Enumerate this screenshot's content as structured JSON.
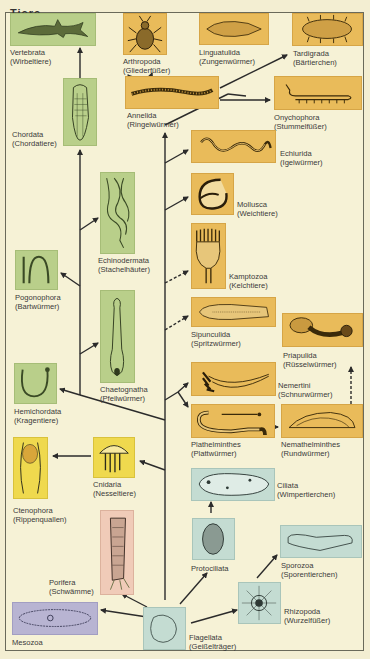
{
  "heading": "Tiere",
  "colors": {
    "background": "#f6f2d6",
    "protostomia_box": "#e9bb5a",
    "deuterostomia_box": "#b9cf8a",
    "cnidaria_box": "#efd94e",
    "protozoa_box": "#c4dcd2",
    "porifera_box": "#f0cbb8",
    "mesozoa_box": "#b8b4d2",
    "line": "#2b2b2b"
  },
  "taxa": {
    "vertebrata": {
      "name": "Vertebrata",
      "common": "(Wirbeltiere)"
    },
    "arthropoda": {
      "name": "Arthropoda",
      "common": "(Gliederfüßer)"
    },
    "linguatulida": {
      "name": "Linguatulida",
      "common": "(Zungenwürmer)"
    },
    "tardigrada": {
      "name": "Tardigrada",
      "common": "(Bärtierchen)"
    },
    "annelida": {
      "name": "Annelida",
      "common": "(Ringelwürmer)"
    },
    "onychophora": {
      "name": "Onychophora",
      "common": "(Stummelfüßer)"
    },
    "chordata": {
      "name": "Chordata",
      "common": "(Chordatiere)"
    },
    "echiurida": {
      "name": "Echiurida",
      "common": "(Igelwürmer)"
    },
    "mollusca": {
      "name": "Mollusca",
      "common": "(Weichtiere)"
    },
    "echinodermata": {
      "name": "Echinodermata",
      "common": "(Stachelhäuter)"
    },
    "kamptozoa": {
      "name": "Kamptozoa",
      "common": "(Kelchtiere)"
    },
    "pogonophora": {
      "name": "Pogonophora",
      "common": "(Bartwürmer)"
    },
    "sipunculida": {
      "name": "Sipunculida",
      "common": "(Spritzwürmer)"
    },
    "priapulida": {
      "name": "Priapulida",
      "common": "(Rüsselwürmer)"
    },
    "chaetognatha": {
      "name": "Chaetognatha",
      "common": "(Pfeilwürmer)"
    },
    "nemertini": {
      "name": "Nemertini",
      "common": "(Schnurwürmer)"
    },
    "hemichordata": {
      "name": "Hemichordata",
      "common": "(Kragentiere)"
    },
    "plathelminthes": {
      "name": "Plathelminthes",
      "common": "(Plattwürmer)"
    },
    "nemathelminthes": {
      "name": "Nemathelminthes",
      "common": "(Rundwürmer)"
    },
    "cnidaria": {
      "name": "Cnidaria",
      "common": "(Nesseltiere)"
    },
    "ctenophora": {
      "name": "Ctenophora",
      "common": "(Rippenquallen)"
    },
    "ciliata": {
      "name": "Ciliata",
      "common": "(Wimpertierchen)"
    },
    "protociliata": {
      "name": "Protociliata",
      "common": ""
    },
    "sporozoa": {
      "name": "Sporozoa",
      "common": "(Sporentierchen)"
    },
    "porifera": {
      "name": "Porifera",
      "common": "(Schwämme)"
    },
    "rhizopoda": {
      "name": "Rhizopoda",
      "common": "(Wurzelfüßer)"
    },
    "mesozoa": {
      "name": "Mesozoa",
      "common": ""
    },
    "flagellata": {
      "name": "Flagellata",
      "common": "(Geißelträger)"
    }
  },
  "edges": [
    {
      "from": "flagellata",
      "to": "mesozoa",
      "style": "solid"
    },
    {
      "from": "flagellata",
      "to": "porifera",
      "style": "solid"
    },
    {
      "from": "flagellata",
      "to": "protociliata",
      "style": "solid"
    },
    {
      "from": "flagellata",
      "to": "rhizopoda",
      "style": "solid"
    },
    {
      "from": "protociliata",
      "to": "ciliata",
      "style": "solid"
    },
    {
      "from": "rhizopoda",
      "to": "sporozoa",
      "style": "solid"
    },
    {
      "from": "flagellata",
      "to": "cnidaria",
      "style": "solid"
    },
    {
      "from": "cnidaria",
      "to": "ctenophora",
      "style": "solid"
    },
    {
      "from": "trunk",
      "to": "plathelminthes",
      "style": "solid"
    },
    {
      "from": "trunk",
      "to": "nemertini",
      "style": "solid"
    },
    {
      "from": "plathelminthes",
      "to": "nemathelminthes",
      "style": "dashed"
    },
    {
      "from": "nemathelminthes",
      "to": "priapulida",
      "style": "dashed"
    },
    {
      "from": "trunk",
      "to": "sipunculida",
      "style": "dashed"
    },
    {
      "from": "trunk",
      "to": "kamptozoa",
      "style": "dashed"
    },
    {
      "from": "trunk",
      "to": "mollusca",
      "style": "solid"
    },
    {
      "from": "trunk",
      "to": "echiurida",
      "style": "solid"
    },
    {
      "from": "trunk",
      "to": "annelida",
      "style": "solid"
    },
    {
      "from": "annelida",
      "to": "arthropoda",
      "style": "solid"
    },
    {
      "from": "annelida",
      "to": "linguatulida",
      "style": "solid"
    },
    {
      "from": "annelida",
      "to": "tardigrada",
      "style": "solid"
    },
    {
      "from": "annelida",
      "to": "onychophora",
      "style": "solid"
    },
    {
      "from": "trunk",
      "to": "hemichordata",
      "style": "solid"
    },
    {
      "from": "deuterostome_trunk",
      "to": "chaetognatha",
      "style": "solid"
    },
    {
      "from": "deuterostome_trunk",
      "to": "pogonophora",
      "style": "solid"
    },
    {
      "from": "deuterostome_trunk",
      "to": "echinodermata",
      "style": "solid"
    },
    {
      "from": "deuterostome_trunk",
      "to": "chordata",
      "style": "solid"
    },
    {
      "from": "chordata",
      "to": "vertebrata",
      "style": "solid"
    }
  ]
}
